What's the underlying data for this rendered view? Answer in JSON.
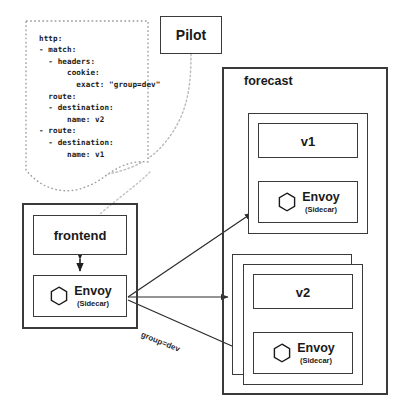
{
  "diagram": {
    "stroke_color": "#3a3a3a",
    "text_color": "#1a1a1a",
    "background": "#ffffff"
  },
  "pilot": {
    "label": "Pilot"
  },
  "config_callout": {
    "yaml": "http:\n- match:\n  - headers:\n      cookie:\n        exact: \"group=dev\"\n  route:\n  - destination:\n      name: v2\n- route:\n  - destination:\n      name: v1",
    "lines": [
      "http:",
      "- match:",
      "  - headers:",
      "      cookie:",
      "        exact: \"group=dev\"",
      "  route:",
      "  - destination:",
      "      name: v2",
      "- route:",
      "  - destination:",
      "      name: v1"
    ]
  },
  "frontend_pod": {
    "app_label": "frontend",
    "envoy": {
      "name": "Envoy",
      "subtitle": "(Sidecar)",
      "icon": "hexagon-icon"
    }
  },
  "forecast": {
    "title": "forecast",
    "v1_pod": {
      "app_label": "v1",
      "envoy": {
        "name": "Envoy",
        "subtitle": "(Sidecar)",
        "icon": "hexagon-icon"
      }
    },
    "v2_pod": {
      "app_label": "v2",
      "envoy": {
        "name": "Envoy",
        "subtitle": "(Sidecar)",
        "icon": "hexagon-icon"
      }
    }
  },
  "edges": {
    "group_dev_label": "group=dev"
  }
}
